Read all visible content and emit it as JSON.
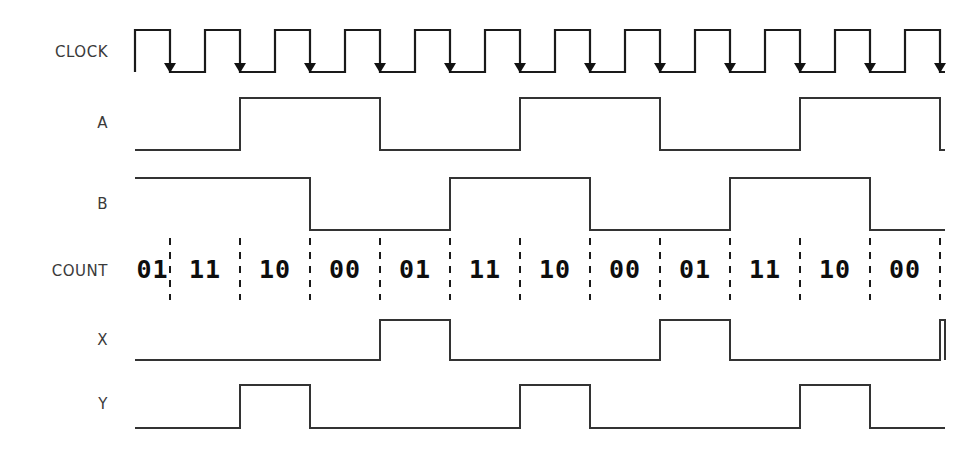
{
  "diagram": {
    "type": "timing-waveform",
    "background_color": "#ffffff",
    "line_color": "#333333",
    "text_color": "#3a3a3a",
    "count_text_color": "#0d0d0d",
    "divider_color": "#1a1a1a"
  },
  "geometry": {
    "width": 975,
    "height": 457,
    "wave_start_x": 135,
    "wave_end_x": 945,
    "clock_half_period": 35,
    "clock_period": 70,
    "num_clock_cycles": 12,
    "first_falling_edge_x": 170,
    "label_x": 108
  },
  "rows": [
    {
      "id": "clock",
      "label": "CLOCK",
      "label_y": 57,
      "high_y": 30,
      "low_y": 72,
      "kind": "clock",
      "initial_level": 0,
      "has_falling_edge_arrows": true
    },
    {
      "id": "a",
      "label": "A",
      "label_y": 128,
      "high_y": 98,
      "low_y": 150,
      "kind": "signal",
      "initial_level": 0,
      "levels": [
        0,
        1,
        1,
        0,
        0,
        1,
        1,
        0,
        0,
        1,
        1,
        0
      ]
    },
    {
      "id": "b",
      "label": "B",
      "label_y": 209,
      "high_y": 178,
      "low_y": 230,
      "kind": "signal",
      "initial_level": 1,
      "levels": [
        1,
        1,
        0,
        0,
        1,
        1,
        0,
        0,
        1,
        1,
        0,
        0
      ]
    },
    {
      "id": "count",
      "label": "COUNT",
      "label_y": 276,
      "kind": "bus",
      "text_y": 278,
      "divider_top": 238,
      "divider_bottom": 300
    },
    {
      "id": "x",
      "label": "X",
      "label_y": 345,
      "high_y": 320,
      "low_y": 360,
      "kind": "signal",
      "initial_level": 0,
      "levels": [
        0,
        0,
        0,
        1,
        0,
        0,
        0,
        1,
        0,
        0,
        0,
        1
      ]
    },
    {
      "id": "y",
      "label": "Y",
      "label_y": 409,
      "high_y": 385,
      "low_y": 428,
      "kind": "signal",
      "initial_level": 0,
      "levels": [
        0,
        1,
        0,
        0,
        0,
        1,
        0,
        0,
        0,
        1,
        0,
        0
      ]
    }
  ],
  "count_values": [
    "01",
    "11",
    "10",
    "00",
    "01",
    "11",
    "10",
    "00",
    "01",
    "11",
    "10",
    "00"
  ],
  "count_sequence_note": "COUNT = {B,A} repeating 01 11 10 00"
}
